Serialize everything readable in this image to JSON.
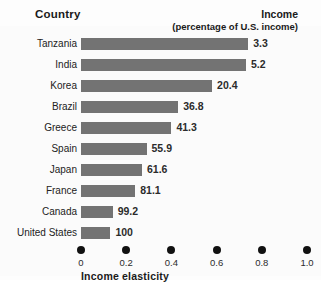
{
  "header": {
    "country_label": "Country",
    "income_label": "Income",
    "income_sublabel": "(percentage of U.S. income)"
  },
  "axis": {
    "title": "Income elasticity",
    "tick_labels": [
      "0",
      "0.2",
      "0.4",
      "0.6",
      "0.8",
      "1.0"
    ]
  },
  "colors": {
    "bar": "#737373",
    "tick_dot": "#111111",
    "text": "#1a1a1a",
    "background": "#ffffff"
  },
  "chart_data": {
    "type": "bar",
    "orientation": "horizontal",
    "title": "",
    "xlabel": "Income elasticity",
    "ylabel": "Country",
    "xlim": [
      0,
      1.0
    ],
    "xticks": [
      0,
      0.2,
      0.4,
      0.6,
      0.8,
      1.0
    ],
    "grid": false,
    "legend": false,
    "categories": [
      "Tanzania",
      "India",
      "Korea",
      "Brazil",
      "Greece",
      "Spain",
      "Japan",
      "France",
      "Canada",
      "United States"
    ],
    "values": [
      0.74,
      0.73,
      0.58,
      0.43,
      0.4,
      0.29,
      0.27,
      0.24,
      0.14,
      0.13
    ],
    "data_labels": [
      "3.3",
      "5.2",
      "20.4",
      "36.8",
      "41.3",
      "55.9",
      "61.6",
      "81.1",
      "99.2",
      "100"
    ],
    "data_label_name": "Income (percentage of U.S. income)",
    "rows": [
      {
        "country": "Tanzania",
        "elasticity": 0.74,
        "income_pct": "3.3"
      },
      {
        "country": "India",
        "elasticity": 0.73,
        "income_pct": "5.2"
      },
      {
        "country": "Korea",
        "elasticity": 0.58,
        "income_pct": "20.4"
      },
      {
        "country": "Brazil",
        "elasticity": 0.43,
        "income_pct": "36.8"
      },
      {
        "country": "Greece",
        "elasticity": 0.4,
        "income_pct": "41.3"
      },
      {
        "country": "Spain",
        "elasticity": 0.29,
        "income_pct": "55.9"
      },
      {
        "country": "Japan",
        "elasticity": 0.27,
        "income_pct": "61.6"
      },
      {
        "country": "France",
        "elasticity": 0.24,
        "income_pct": "81.1"
      },
      {
        "country": "Canada",
        "elasticity": 0.14,
        "income_pct": "99.2"
      },
      {
        "country": "United States",
        "elasticity": 0.13,
        "income_pct": "100"
      }
    ]
  }
}
